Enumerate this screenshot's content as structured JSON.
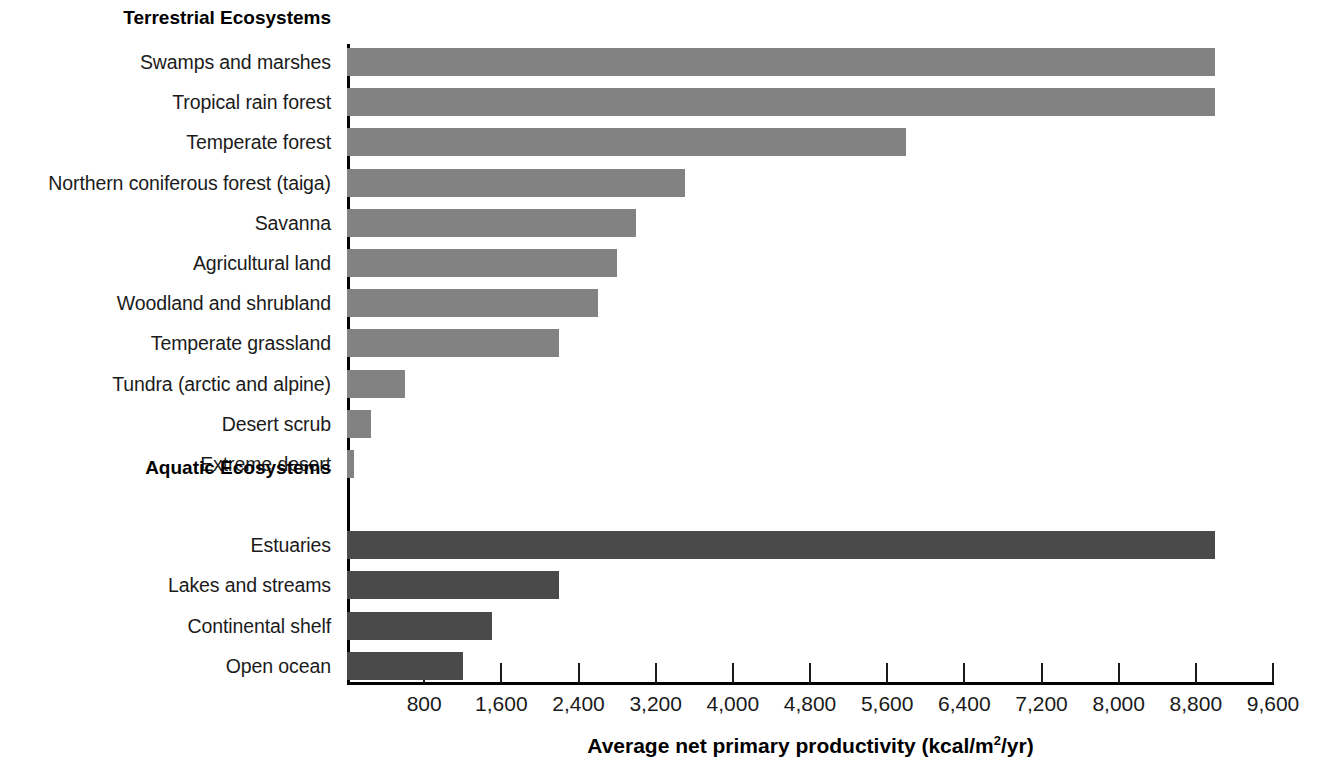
{
  "chart_data": {
    "type": "bar",
    "orientation": "horizontal",
    "title": "",
    "xlabel": "Average net primary productivity (kcal/m2/yr)",
    "xlabel_parts": {
      "before": "Average net primary productivity (kcal/m",
      "sup": "2",
      "after": "/yr)"
    },
    "ylabel": "",
    "xlim": [
      0,
      9600
    ],
    "grid": false,
    "legend": null,
    "xticks": [
      800,
      1600,
      2400,
      3200,
      4000,
      4800,
      5600,
      6400,
      7200,
      8000,
      8800,
      9600
    ],
    "xtick_labels": [
      "800",
      "1,600",
      "2,400",
      "3,200",
      "4,000",
      "4,800",
      "5,600",
      "6,400",
      "7,200",
      "8,000",
      "8,800",
      "9,600"
    ],
    "sections": [
      {
        "name": "Terrestrial Ecosystems",
        "color": "#828282",
        "categories": [
          "Swamps and marshes",
          "Tropical rain forest",
          "Temperate forest",
          "Northern coniferous forest (taiga)",
          "Savanna",
          "Agricultural land",
          "Woodland and shrubland",
          "Temperate grassland",
          "Tundra (arctic and alpine)",
          "Desert scrub",
          "Extreme desert"
        ],
        "values": [
          9000,
          9000,
          5800,
          3500,
          3000,
          2800,
          2600,
          2200,
          600,
          250,
          70
        ]
      },
      {
        "name": "Aquatic Ecosystems",
        "color": "#4a4a4a",
        "categories": [
          "Estuaries",
          "Lakes and streams",
          "Continental shelf",
          "Open ocean"
        ],
        "values": [
          9000,
          2200,
          1500,
          1200
        ]
      }
    ]
  },
  "colors": {
    "terrestrial_bar": "#828282",
    "aquatic_bar": "#4a4a4a",
    "axis": "#000000",
    "text": "#1a1a1a",
    "background": "#ffffff"
  }
}
